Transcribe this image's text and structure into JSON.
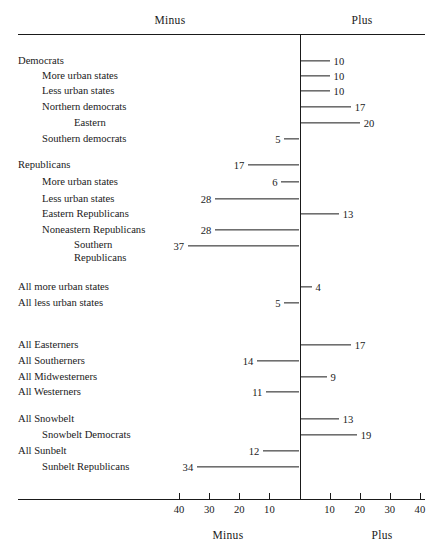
{
  "chart_data": {
    "type": "bar",
    "orientation": "horizontal",
    "title": "",
    "xlabel": "",
    "ylabel": "",
    "axis_headers": {
      "left": "Minus",
      "right": "Plus"
    },
    "footer_headers": {
      "left": "Minus",
      "right": "Plus"
    },
    "xlim": [
      -45,
      45
    ],
    "zero_value": 0,
    "grid": false,
    "tick_values": [
      -40,
      -30,
      -20,
      -10,
      10,
      20,
      30,
      40
    ],
    "tick_labels": [
      "40",
      "30",
      "20",
      "10",
      "10",
      "20",
      "30",
      "40"
    ],
    "categories": [
      "Democrats",
      "More urban states",
      "Less urban states",
      "Northern democrats",
      "Eastern",
      "Southern democrats",
      "Republicans",
      "More urban states",
      "Less urban states",
      "Eastern Republicans",
      "Noneastern Republicans",
      "Southern Republicans",
      "All more urban states",
      "All less urban states",
      "All Easterners",
      "All Southerners",
      "All Midwesterners",
      "All Westerners",
      "All Snowbelt",
      "Snowbelt Democrats",
      "All Sunbelt",
      "Sunbelt Republicans"
    ],
    "values": [
      10,
      10,
      10,
      17,
      20,
      -5,
      -17,
      -6,
      -28,
      13,
      -28,
      -37,
      4,
      -5,
      17,
      -14,
      9,
      -11,
      13,
      19,
      -12,
      -34
    ],
    "value_labels": [
      "10",
      "10",
      "10",
      "17",
      "20",
      "5",
      "17",
      "6",
      "28",
      "13",
      "28",
      "37",
      "4",
      "5",
      "17",
      "14",
      "9",
      "11",
      "13",
      "19",
      "12",
      "34"
    ]
  },
  "rows": [
    {
      "label": "Democrats",
      "value": 10,
      "display": "10",
      "indent": 0,
      "y": 61
    },
    {
      "label": "More urban states",
      "value": 10,
      "display": "10",
      "indent": 1,
      "y": 76
    },
    {
      "label": "Less urban states",
      "value": 10,
      "display": "10",
      "indent": 1,
      "y": 91
    },
    {
      "label": "Northern democrats",
      "value": 17,
      "display": "17",
      "indent": 1,
      "y": 107
    },
    {
      "label": "Eastern",
      "value": 20,
      "display": "20",
      "indent": 2,
      "y": 123
    },
    {
      "label": "Southern democrats",
      "value": -5,
      "display": "5",
      "indent": 1,
      "y": 139
    },
    {
      "label": "Republicans",
      "value": -17,
      "display": "17",
      "indent": 0,
      "y": 165
    },
    {
      "label": "More urban states",
      "value": -6,
      "display": "6",
      "indent": 1,
      "y": 182
    },
    {
      "label": "Less urban states",
      "value": -28,
      "display": "28",
      "indent": 1,
      "y": 199
    },
    {
      "label": "Eastern Republicans",
      "value": 13,
      "display": "13",
      "indent": 1,
      "y": 214
    },
    {
      "label": "Noneastern Republicans",
      "value": -28,
      "display": "28",
      "indent": 1,
      "y": 230
    },
    {
      "label": "Southern",
      "label2": "Republicans",
      "value": -37,
      "display": "37",
      "indent": 2,
      "y": 246
    },
    {
      "label": "All more urban states",
      "value": 4,
      "display": "4",
      "indent": 0,
      "y": 287
    },
    {
      "label": "All less urban states",
      "value": -5,
      "display": "5",
      "indent": 0,
      "y": 303
    },
    {
      "label": "All Easterners",
      "value": 17,
      "display": "17",
      "indent": 0,
      "y": 345
    },
    {
      "label": "All Southerners",
      "value": -14,
      "display": "14",
      "indent": 0,
      "y": 361
    },
    {
      "label": "All Midwesterners",
      "value": 9,
      "display": "9",
      "indent": 0,
      "y": 377
    },
    {
      "label": "All Westerners",
      "value": -11,
      "display": "11",
      "indent": 0,
      "y": 392
    },
    {
      "label": "All Snowbelt",
      "value": 13,
      "display": "13",
      "indent": 0,
      "y": 419
    },
    {
      "label": "Snowbelt Democrats",
      "value": 19,
      "display": "19",
      "indent": 1,
      "y": 435
    },
    {
      "label": "All Sunbelt",
      "value": -12,
      "display": "12",
      "indent": 0,
      "y": 451
    },
    {
      "label": "Sunbelt Republicans",
      "value": -34,
      "display": "34",
      "indent": 1,
      "y": 467
    }
  ],
  "header": {
    "left": "Minus",
    "right": "Plus"
  },
  "footer": {
    "left": "Minus",
    "right": "Plus"
  },
  "ticks": [
    {
      "label": "40",
      "value": -40
    },
    {
      "label": "30",
      "value": -30
    },
    {
      "label": "20",
      "value": -20
    },
    {
      "label": "10",
      "value": -10
    },
    {
      "label": "10",
      "value": 10
    },
    {
      "label": "20",
      "value": 20
    },
    {
      "label": "30",
      "value": 30
    },
    {
      "label": "40",
      "value": 40
    }
  ],
  "colors": {
    "ink": "#1a1a1a",
    "background": "#ffffff"
  }
}
